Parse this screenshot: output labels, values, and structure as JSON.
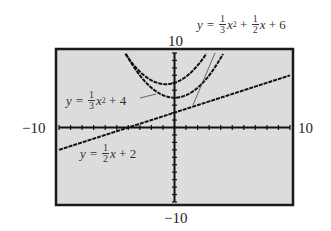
{
  "chart_data": {
    "type": "line",
    "title": "",
    "xlabel": "",
    "ylabel": "",
    "xlim": [
      -10,
      10
    ],
    "ylim": [
      -10,
      10
    ],
    "grid": false,
    "axis_ticks": {
      "x_step": 1,
      "y_step": 1
    },
    "window_labels": {
      "xmin": "-10",
      "xmax": "10",
      "ymin": "-10",
      "ymax": "10"
    },
    "series": [
      {
        "name": "y = 1/3 x^2 + 1/2 x + 6",
        "type": "parabola",
        "a": 0.3333,
        "b": 0.5,
        "c": 6
      },
      {
        "name": "y = 1/3 x^2 + 4",
        "type": "parabola",
        "a": 0.3333,
        "b": 0,
        "c": 4
      },
      {
        "name": "y = 1/2 x + 2",
        "type": "line",
        "a": 0,
        "b": 0.5,
        "c": 2
      }
    ],
    "annotations": [
      {
        "text": "y = 1/3 x^2 + 1/2 x + 6",
        "position": "top-right"
      },
      {
        "text": "y = 1/3 x^2 + 4",
        "position": "upper-left"
      },
      {
        "text": "y = 1/2 x + 2",
        "position": "lower-left"
      }
    ]
  },
  "labels": {
    "ymax": "10",
    "ymin": "−10",
    "xmin": "−10",
    "xmax": "10"
  },
  "equations": {
    "eq1": {
      "lhs": "y =",
      "f1n": "1",
      "f1d": "3",
      "x2": "x",
      "exp": "2",
      "plus1": "+",
      "f2n": "1",
      "f2d": "2",
      "x1": "x",
      "rest": "+ 6"
    },
    "eq2": {
      "lhs": "y =",
      "fn": "1",
      "fd": "3",
      "x": "x",
      "exp": "2",
      "rest": "+ 4"
    },
    "eq3": {
      "lhs": "y =",
      "fn": "1",
      "fd": "2",
      "x": "x",
      "rest": "+ 2"
    }
  },
  "colors": {
    "screen": "#dcdcdc",
    "frame": "#1a1a1a",
    "curve": "#111111",
    "leader": "#444444"
  }
}
